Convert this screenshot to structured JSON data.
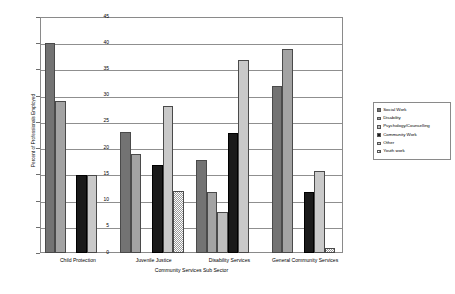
{
  "chart_data": {
    "type": "bar",
    "title": "",
    "xlabel": "Community Services Sub Sector",
    "ylabel": "Percent of Professionals Employed",
    "ylim": [
      0,
      45
    ],
    "ytick_step": 5,
    "yticks": [
      "0",
      "5",
      "10",
      "15",
      "20",
      "25",
      "30",
      "35",
      "40",
      "45"
    ],
    "grid": true,
    "legend_position": "right",
    "categories": [
      "Child Protection",
      "Juvenile Justice",
      "Disability Services",
      "General Community Services"
    ],
    "series": [
      {
        "name": "Social Work",
        "color": "#737373",
        "values": [
          40,
          23,
          17.8,
          31.8
        ]
      },
      {
        "name": "Disability",
        "color": "#a3a3a3",
        "values": [
          29,
          18.9,
          11.6,
          38.9
        ]
      },
      {
        "name": "Psychology/Counselling",
        "color": "#bdbdbd",
        "values": [
          0,
          0,
          7.8,
          0
        ]
      },
      {
        "name": "Community Work",
        "color": "#1a1a1a",
        "values": [
          14.9,
          16.8,
          22.8,
          11.7
        ]
      },
      {
        "name": "Other",
        "color": "#c9c9c9",
        "values": [
          14.9,
          28,
          36.8,
          15.7
        ]
      },
      {
        "name": "Youth work",
        "color": "#ffffff",
        "values": [
          0,
          11.8,
          0,
          0.9
        ]
      }
    ]
  },
  "legend": {
    "items": [
      {
        "label": "Social Work"
      },
      {
        "label": "Disability"
      },
      {
        "label": "Psychology/Counselling"
      },
      {
        "label": "Community Work"
      },
      {
        "label": "Other"
      },
      {
        "label": "Youth work"
      }
    ]
  }
}
